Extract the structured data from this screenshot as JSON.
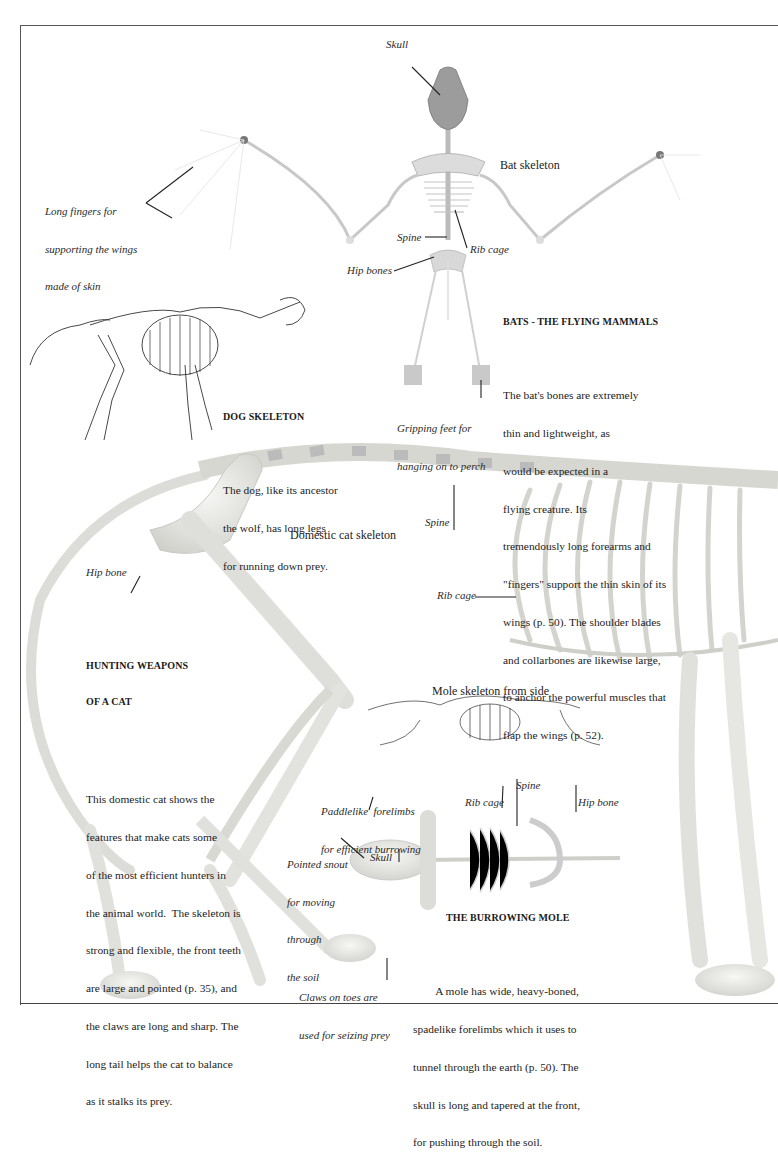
{
  "page": {
    "type": "book-page"
  },
  "bat": {
    "title_label": "Bat skeleton",
    "labels": {
      "skull": "Skull",
      "fingers": [
        "Long fingers for",
        "supporting the wings",
        "made of skin"
      ],
      "spine": "Spine",
      "rib_cage": "Rib cage",
      "hip_bones": "Hip bones",
      "feet": [
        "Gripping feet for",
        "hanging on to perch"
      ]
    },
    "caption": {
      "heading": "BATS - THE FLYING MAMMALS",
      "lines": [
        "The bat's bones are extremely",
        "thin and lightweight, as",
        "would be expected in a",
        "flying creature. Its",
        "tremendously long forearms and",
        "\"fingers\" support the thin skin of its",
        "wings (p. 50). The shoulder blades",
        "and collarbones are likewise large,",
        "to anchor the powerful muscles that",
        "flap the wings (p. 52)."
      ]
    }
  },
  "dog": {
    "caption": {
      "heading": "DOG SKELETON",
      "lines": [
        "The dog, like its ancestor",
        "the wolf, has long legs",
        "for running down prey."
      ]
    }
  },
  "cat": {
    "title_label": "Domestic cat skeleton",
    "labels": {
      "spine": "Spine",
      "hip_bone": "Hip bone",
      "rib_cage": "Rib cage",
      "claws": [
        "Claws on toes are",
        "used for seizing prey"
      ]
    },
    "caption": {
      "heading_lines": [
        "HUNTING WEAPONS",
        "OF A CAT"
      ],
      "lines": [
        "This domestic cat shows the",
        "features that make cats some",
        "of the most efficient hunters in",
        "the animal world.  The skeleton is",
        "strong and flexible, the front teeth",
        "are large and pointed (p. 35), and",
        "the claws are long and sharp. The",
        "long tail helps the cat to balance",
        "as it stalks its prey."
      ]
    }
  },
  "mole": {
    "side_label": "Mole skeleton from side",
    "labels": {
      "forelimbs": [
        "Paddlelike  forelimbs",
        "for efficient burrowing"
      ],
      "rib_cage": "Rib cage",
      "spine": "Spine",
      "hip_bone": "Hip bone",
      "snout": [
        "Pointed snout",
        "for moving",
        "through",
        "the soil"
      ],
      "skull": "Skull"
    },
    "caption": {
      "heading": "THE BURROWING MOLE",
      "lines": [
        "        A mole has wide, heavy-boned,",
        "spadelike forelimbs which it uses to",
        "tunnel through the earth (p. 50). The",
        "skull is long and tapered at the front,",
        "for pushing through the soil."
      ]
    }
  },
  "colors": {
    "ink": "#1e1e1e",
    "bone": "#e9e9e6",
    "bone_shadow": "#bdbdb8",
    "frame": "#555555"
  }
}
